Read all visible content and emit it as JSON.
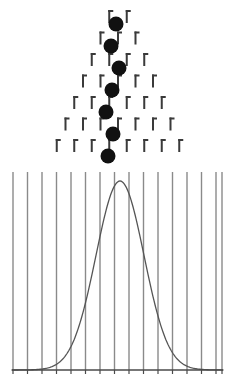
{
  "figure": {
    "width": 235,
    "height": 390,
    "background_color": "#ffffff"
  },
  "board": {
    "name": "galton-board-peg-array",
    "peg_color": "#3a3a3a",
    "peg_rows": 7,
    "peg_width": 2,
    "peg_height": 13,
    "peg_cap_width": 5,
    "row_spacing": 21.5,
    "column_spacing": 17.5,
    "first_row_y": 10,
    "center_x": 118,
    "peg_counts": [
      2,
      3,
      4,
      5,
      6,
      7,
      8
    ],
    "description": "Triangular array of pegs; each successive row has one more peg and is offset half a column."
  },
  "balls": {
    "name": "falling-balls",
    "color": "#111111",
    "radius": 7.5,
    "count": 7,
    "positions": [
      {
        "x": 116,
        "y": 24
      },
      {
        "x": 111,
        "y": 46
      },
      {
        "x": 119,
        "y": 68
      },
      {
        "x": 112,
        "y": 90
      },
      {
        "x": 106,
        "y": 112
      },
      {
        "x": 113,
        "y": 134
      },
      {
        "x": 108,
        "y": 156
      }
    ]
  },
  "bins": {
    "name": "histogram-bin-dividers",
    "divider_color": "#8a8a8a",
    "divider_width": 1.4,
    "top_y": 172,
    "bottom_y": 370,
    "count": 16,
    "x_positions": [
      13,
      27.5,
      42,
      56.5,
      71,
      85.5,
      100,
      114.5,
      129,
      143.5,
      158,
      172.5,
      187,
      201.5,
      216,
      222
    ]
  },
  "axis": {
    "name": "baseline-axis",
    "color": "#4a4a4a",
    "width": 1.6,
    "y": 370,
    "x_start": 12,
    "x_end": 223,
    "tick_color": "#4a4a4a",
    "tick_height": 4,
    "tick_x_positions": [
      13,
      27.5,
      42,
      56.5,
      71,
      85.5,
      100,
      114.5,
      129,
      143.5,
      158,
      172.5,
      187,
      201.5,
      216,
      222
    ]
  },
  "chart_data": {
    "type": "line",
    "subtitle": "Bell curve formed by balls falling through the Galton board",
    "xlabel": "",
    "ylabel": "",
    "grid": true,
    "legend": null,
    "curve_color": "#555555",
    "curve_width": 1.3,
    "mean": 120,
    "sigma": 24,
    "baseline_y": 370,
    "peak_y": 181,
    "peak_height": 189,
    "xlim": [
      12,
      223
    ],
    "ylim": [
      0,
      1
    ],
    "x": [
      12,
      22,
      32,
      42,
      52,
      58,
      64,
      70,
      76,
      82,
      88,
      94,
      100,
      106,
      112,
      120,
      128,
      134,
      140,
      146,
      152,
      158,
      164,
      170,
      176,
      182,
      188,
      198,
      208,
      218,
      223
    ],
    "y": [
      0.0,
      0.0,
      0.001,
      0.002,
      0.006,
      0.012,
      0.023,
      0.041,
      0.07,
      0.113,
      0.172,
      0.247,
      0.336,
      0.5,
      0.72,
      1.0,
      0.72,
      0.5,
      0.336,
      0.247,
      0.172,
      0.113,
      0.07,
      0.041,
      0.023,
      0.012,
      0.006,
      0.002,
      0.001,
      0.0,
      0.0
    ]
  }
}
